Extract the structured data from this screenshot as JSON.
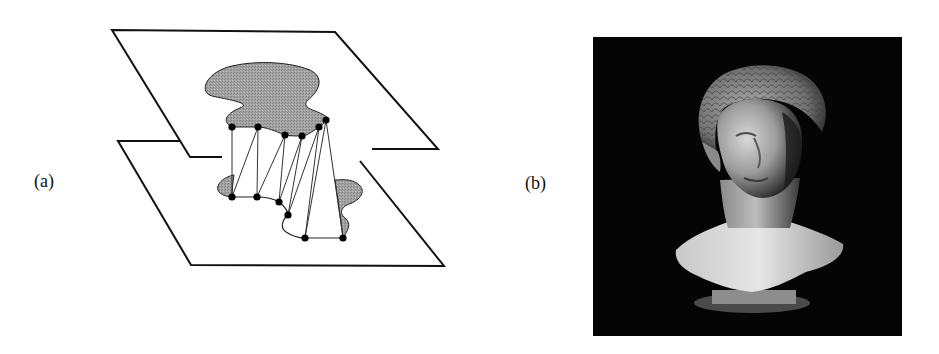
{
  "figure": {
    "panels": [
      {
        "id": "a",
        "label": "(a)",
        "description": "Two parallel planes with shaded contour regions connected by triangulated surface between contour vertices"
      },
      {
        "id": "b",
        "label": "(b)",
        "description": "Photograph of a classical marble bust on a black background"
      }
    ]
  },
  "diagram": {
    "top_plane": [
      [
        112,
        30
      ],
      [
        335,
        32
      ],
      [
        438,
        149
      ],
      [
        372,
        149
      ]
    ],
    "top_plane_left_open": [
      [
        112,
        30
      ],
      [
        190,
        157
      ],
      [
        222,
        157
      ]
    ],
    "bottom_plane": [
      [
        118,
        141
      ],
      [
        180,
        141
      ]
    ],
    "top_dots": [
      [
        232,
        127
      ],
      [
        258,
        127
      ],
      [
        285,
        135
      ],
      [
        302,
        136
      ],
      [
        319,
        127
      ],
      [
        326,
        120
      ]
    ],
    "bottom_dots": [
      [
        232,
        197
      ],
      [
        257,
        197
      ],
      [
        279,
        202
      ],
      [
        288,
        215
      ],
      [
        305,
        238
      ],
      [
        343,
        238
      ]
    ],
    "colors": {
      "line": "#111111",
      "fill": "#9a9a9a",
      "dot": "#000000"
    }
  },
  "photo": {
    "bg": "#050505",
    "x": 593,
    "y": 37,
    "w": 309,
    "h": 299
  }
}
